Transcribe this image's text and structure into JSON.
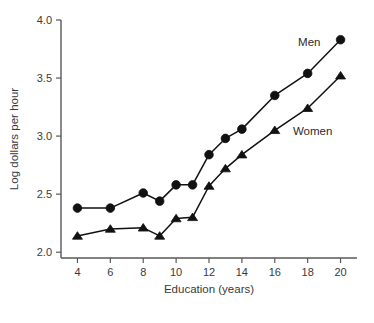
{
  "chart_data": {
    "type": "line",
    "title": "",
    "subtitle": "",
    "xlabel": "Education (years)",
    "ylabel": "Log dollars per hour",
    "x": [
      4,
      6,
      8,
      9,
      10,
      11,
      12,
      13,
      14,
      16,
      18,
      20
    ],
    "xticks": [
      "4",
      "6",
      "8",
      "10",
      "12",
      "14",
      "16",
      "18",
      "20"
    ],
    "xtick_values": [
      4,
      6,
      8,
      10,
      12,
      14,
      16,
      18,
      20
    ],
    "yticks": [
      "2.0",
      "2.5",
      "3.0",
      "3.5",
      "4.0"
    ],
    "ytick_values": [
      2.0,
      2.5,
      3.0,
      3.5,
      4.0
    ],
    "xlim": [
      3,
      21
    ],
    "ylim": [
      1.95,
      4.0
    ],
    "grid": false,
    "legend_position": "inline-annotation",
    "series": [
      {
        "name": "Men",
        "marker": "circle",
        "color": "#111111",
        "values": [
          2.38,
          2.38,
          2.51,
          2.44,
          2.58,
          2.58,
          2.84,
          2.98,
          3.06,
          3.35,
          3.54,
          3.83
        ]
      },
      {
        "name": "Women",
        "marker": "triangle",
        "color": "#111111",
        "values": [
          2.14,
          2.2,
          2.21,
          2.14,
          2.29,
          2.3,
          2.57,
          2.72,
          2.84,
          3.05,
          3.24,
          3.52
        ]
      }
    ],
    "annotations": [
      {
        "text": "Men",
        "x": 18.1,
        "y": 3.78
      },
      {
        "text": "Women",
        "x": 18.3,
        "y": 3.01
      }
    ]
  }
}
